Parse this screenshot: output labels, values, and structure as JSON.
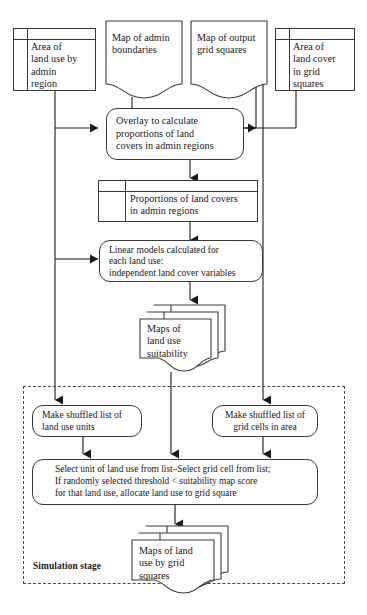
{
  "diagram": {
    "stroke_color": "#3a3a3a",
    "dashed_color": "#4a4a4a",
    "background": "#ffffff"
  },
  "nodes": {
    "area_land_use_admin": {
      "label": "Area of\nland use by\nadmin\nregion",
      "shape": "table"
    },
    "map_admin_boundaries": {
      "label": "Map of admin\nboundaries",
      "shape": "document"
    },
    "map_output_grid": {
      "label": "Map of output\ngrid squares",
      "shape": "document"
    },
    "area_land_cover_grid": {
      "label": "Area of\nland cover\nin grid\nsquares",
      "shape": "table"
    },
    "overlay": {
      "label": "Overlay to calculate\nproportions of land\ncovers in admin regions",
      "shape": "rounded-process"
    },
    "proportions": {
      "label": "Proportions of land covers\nin admin regions",
      "shape": "table"
    },
    "linear_models": {
      "label": "Linear models calculated for\neach land use:\nindependent land cover variables",
      "shape": "rounded-process"
    },
    "maps_suitability": {
      "label": "Maps of\nland use\nsuitability",
      "shape": "document-stack"
    },
    "shuffle_land_use": {
      "label": "Make shuffled list of\nland use units",
      "shape": "rounded-process"
    },
    "shuffle_grid_cells": {
      "label": "Make shuffled list of\ngrid cells in area",
      "shape": "rounded-process"
    },
    "select_allocate": {
      "label": "Select unit of land use from list–Select grid cell from list;\nIf randomly selected threshold < suitability map score\nfor that land use, allocate land use to grid square",
      "shape": "rounded-process"
    },
    "maps_output": {
      "label": "Maps of land\nuse by grid\nsquares",
      "shape": "document-stack"
    },
    "simulation_stage": {
      "label": "Simulation stage",
      "shape": "dashed-region"
    }
  }
}
